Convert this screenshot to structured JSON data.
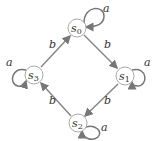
{
  "diagram": {
    "type": "state-transition-graph",
    "nodes": [
      {
        "id": "s0",
        "base": "s",
        "sub": "0",
        "x": 77,
        "y": 28
      },
      {
        "id": "s1",
        "base": "s",
        "sub": "1",
        "x": 125,
        "y": 76
      },
      {
        "id": "s2",
        "base": "s",
        "sub": "2",
        "x": 78,
        "y": 123
      },
      {
        "id": "s3",
        "base": "s",
        "sub": "3",
        "x": 34,
        "y": 75
      }
    ],
    "edges": [
      {
        "from": "s0",
        "to": "s1",
        "label": "b"
      },
      {
        "from": "s1",
        "to": "s2",
        "label": "b"
      },
      {
        "from": "s2",
        "to": "s3",
        "label": "b"
      },
      {
        "from": "s3",
        "to": "s0",
        "label": "b"
      },
      {
        "from": "s0",
        "to": "s0",
        "label": "a"
      },
      {
        "from": "s1",
        "to": "s1",
        "label": "a"
      },
      {
        "from": "s2",
        "to": "s2",
        "label": "a"
      },
      {
        "from": "s3",
        "to": "s3",
        "label": "a"
      }
    ],
    "colors": {
      "edge": "#777777",
      "node_stroke": "#999999",
      "text": "#333333"
    }
  }
}
